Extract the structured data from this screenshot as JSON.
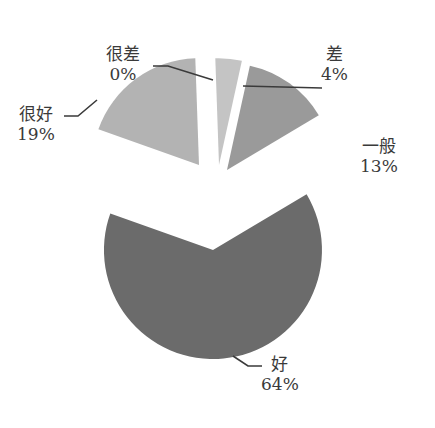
{
  "chart_data": {
    "type": "pie",
    "title": "",
    "exploded": true,
    "categories": [
      "很差",
      "差",
      "一般",
      "好",
      "很好"
    ],
    "values": [
      0,
      4,
      13,
      64,
      19
    ],
    "labels": [
      {
        "name": "很差",
        "pct": "0%"
      },
      {
        "name": "差",
        "pct": "4%"
      },
      {
        "name": "一般",
        "pct": "13%"
      },
      {
        "name": "好",
        "pct": "64%"
      },
      {
        "name": "很好",
        "pct": "19%"
      }
    ],
    "colors": {
      "很差": "#d4d4d4",
      "差": "#c4c4c4",
      "一般": "#9a9a9a",
      "好": "#6b6b6b",
      "很好": "#b3b3b3"
    },
    "legend": "none",
    "grid": false
  }
}
